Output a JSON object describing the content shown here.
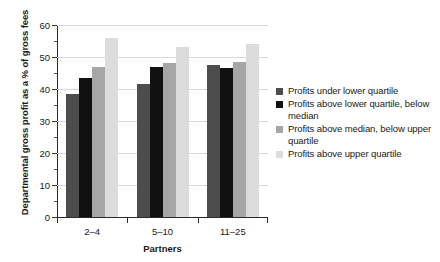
{
  "chart_data": {
    "type": "bar",
    "title": "",
    "xlabel": "Partners",
    "ylabel": "Departmental gross profit as a % of gross fees",
    "categories": [
      "2–4",
      "5–10",
      "11–25"
    ],
    "series": [
      {
        "name": "Profits under lower quartile",
        "color": "#4d4d4d",
        "values": [
          38.5,
          41.5,
          47.5
        ]
      },
      {
        "name": "Profits above lower quartile, below median",
        "color": "#111111",
        "values": [
          43.5,
          47.0,
          46.5
        ]
      },
      {
        "name": "Profits above median, below upper quartile",
        "color": "#a6a6a6",
        "values": [
          47.0,
          48.0,
          48.5
        ]
      },
      {
        "name": "Profits above upper quartile",
        "color": "#dcdcdc",
        "values": [
          56.0,
          53.0,
          54.0
        ]
      }
    ],
    "ylim": [
      0,
      60
    ],
    "yticks": [
      0,
      10,
      20,
      30,
      40,
      50,
      60
    ],
    "ytick_labels": [
      "0",
      "10",
      "20",
      "30",
      "40",
      "50",
      "60"
    ],
    "yminor_ticks": [
      5,
      15,
      25,
      35,
      45,
      55
    ],
    "grid": true,
    "grid_axis": "y",
    "legend_position": "right",
    "legend_entries": [
      "Profits under lower quartile",
      "Profits above lower quartile, below median",
      "Profits above median, below upper quartile",
      "Profits above upper quartile"
    ]
  }
}
